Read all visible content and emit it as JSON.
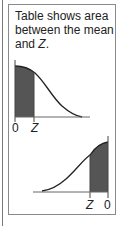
{
  "caption": {
    "line1": "Table shows area",
    "line2": "between the mean",
    "line3_prefix": "and ",
    "line3_var": "Z",
    "line3_suffix": "."
  },
  "top_diagram": {
    "label_left": "0",
    "label_right": "Z",
    "shade_color": "#555555"
  },
  "bottom_diagram": {
    "label_left": "Z",
    "label_right": "0",
    "shade_color": "#555555"
  }
}
